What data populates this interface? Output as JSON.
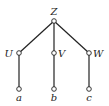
{
  "diagram": {
    "type": "tree",
    "root": {
      "id": "Z",
      "label": "Z"
    },
    "level1": [
      {
        "id": "U",
        "label": "U"
      },
      {
        "id": "V",
        "label": "V"
      },
      {
        "id": "W",
        "label": "W"
      }
    ],
    "leaves": [
      {
        "id": "a",
        "label": "a"
      },
      {
        "id": "b",
        "label": "b"
      },
      {
        "id": "c",
        "label": "c"
      }
    ],
    "edges": [
      [
        "Z",
        "U"
      ],
      [
        "Z",
        "V"
      ],
      [
        "Z",
        "W"
      ],
      [
        "U",
        "a"
      ],
      [
        "V",
        "b"
      ],
      [
        "W",
        "c"
      ]
    ]
  }
}
